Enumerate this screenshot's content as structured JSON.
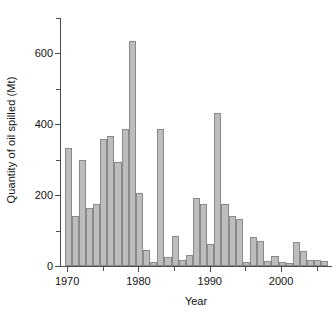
{
  "chart_data": {
    "type": "bar",
    "title": "",
    "xlabel": "Year",
    "ylabel": "Quantity of oil spilled (Mt)",
    "xlim": [
      1969,
      2007
    ],
    "ylim": [
      0,
      700
    ],
    "grid": false,
    "legend": null,
    "y_ticks_major": [
      0,
      200,
      400,
      600
    ],
    "y_ticks_major_labels": [
      "0",
      "200",
      "400",
      "600"
    ],
    "y_ticks_minor": [
      100,
      300,
      500,
      700
    ],
    "x_ticks_major": [
      1970,
      1980,
      1990,
      2000
    ],
    "x_ticks_major_labels": [
      "1970",
      "1980",
      "1990",
      "2000"
    ],
    "x_ticks_minor": [
      1975,
      1985,
      1995,
      2005
    ],
    "bar_color": "#bdbdbd",
    "bar_edge_color": "#8a8a8a",
    "axis_color": "#4d4d4d",
    "categories": [
      1970,
      1971,
      1972,
      1973,
      1974,
      1975,
      1976,
      1977,
      1978,
      1979,
      1980,
      1981,
      1982,
      1983,
      1984,
      1985,
      1986,
      1987,
      1988,
      1989,
      1990,
      1991,
      1992,
      1993,
      1994,
      1995,
      1996,
      1997,
      1998,
      1999,
      2000,
      2001,
      2002,
      2003,
      2004,
      2005,
      2006
    ],
    "values": [
      332,
      140,
      300,
      165,
      175,
      358,
      366,
      295,
      387,
      636,
      207,
      46,
      12,
      386,
      26,
      84,
      18,
      32,
      192,
      175,
      62,
      432,
      174,
      141,
      133,
      11,
      81,
      72,
      13,
      27,
      12,
      8,
      67,
      42,
      16,
      17,
      15
    ]
  }
}
